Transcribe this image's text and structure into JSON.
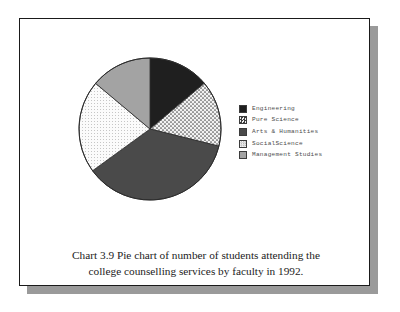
{
  "figure": {
    "caption_line1": "Chart 3.9  Pie chart of number of students attending the",
    "caption_line2": "college counselling services by faculty in 1992."
  },
  "legend": {
    "items": [
      {
        "label": "Engineering",
        "swatch": "solid-black",
        "color": "#1f1f1f"
      },
      {
        "label": "Pure Science",
        "swatch": "dotted-pattern",
        "color": "#e8e8e8"
      },
      {
        "label": "Arts & Humanities",
        "swatch": "dark-grey",
        "color": "#4a4a4a"
      },
      {
        "label": "SocialScience",
        "swatch": "light-fine-dot",
        "color": "#f4f4f4"
      },
      {
        "label": "Management Studies",
        "swatch": "medium-grey",
        "color": "#a3a3a3"
      }
    ]
  },
  "chart_data": {
    "type": "pie",
    "title": "Chart 3.9  Pie chart of number of students attending the college counselling services by faculty in 1992.",
    "categories": [
      "Engineering",
      "Pure Science",
      "Arts & Humanities",
      "SocialScience",
      "Management Studies"
    ],
    "values": [
      14,
      15,
      36,
      21,
      14
    ],
    "units": "percent of students",
    "start_angle_deg": 0,
    "direction": "clockwise",
    "slice_angles_deg": [
      50,
      54,
      130,
      76,
      50
    ],
    "slice_fills": [
      "#1f1f1f",
      "#e8e8e8",
      "#4a4a4a",
      "#f4f4f4",
      "#a3a3a3"
    ],
    "slice_patterns": [
      "solid",
      "coarse-dot",
      "solid",
      "fine-dot",
      "solid"
    ],
    "legend_position": "right",
    "grid": false,
    "xlabel": "",
    "ylabel": ""
  }
}
